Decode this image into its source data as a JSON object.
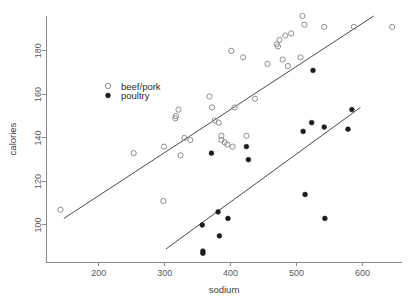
{
  "chart_data": {
    "type": "scatter",
    "title": "",
    "xlabel": "sodium",
    "ylabel": "calories",
    "xlim": [
      120,
      660
    ],
    "ylim": [
      83,
      196
    ],
    "grid": false,
    "xticks": [
      200,
      300,
      400,
      500,
      600
    ],
    "yticks": [
      100,
      120,
      140,
      160,
      180
    ],
    "legend_position": "upper-left-inside",
    "series": [
      {
        "name": "beef/pork",
        "marker": "open-circle",
        "color": "#8e8e8e",
        "points": [
          [
            142,
            107
          ],
          [
            253,
            133
          ],
          [
            298,
            111
          ],
          [
            299,
            136
          ],
          [
            316,
            149
          ],
          [
            317,
            150
          ],
          [
            321,
            153
          ],
          [
            324,
            132
          ],
          [
            330,
            140
          ],
          [
            339,
            139
          ],
          [
            368,
            159
          ],
          [
            372,
            154
          ],
          [
            376,
            148
          ],
          [
            382,
            147
          ],
          [
            386,
            139
          ],
          [
            386,
            141
          ],
          [
            391,
            138
          ],
          [
            395,
            137
          ],
          [
            401,
            180
          ],
          [
            403,
            136
          ],
          [
            406,
            154
          ],
          [
            419,
            177
          ],
          [
            424,
            141
          ],
          [
            437,
            158
          ],
          [
            456,
            174
          ],
          [
            470,
            183
          ],
          [
            472,
            182
          ],
          [
            474,
            185
          ],
          [
            479,
            176
          ],
          [
            483,
            187
          ],
          [
            487,
            173
          ],
          [
            492,
            188
          ],
          [
            506,
            177
          ],
          [
            509,
            196
          ],
          [
            512,
            192
          ],
          [
            542,
            191
          ],
          [
            587,
            191
          ],
          [
            645,
            191
          ]
        ]
      },
      {
        "name": "poultry",
        "marker": "filled-circle",
        "color": "#1c1c1c",
        "points": [
          [
            357,
            100
          ],
          [
            358,
            88
          ],
          [
            358,
            87
          ],
          [
            371,
            133
          ],
          [
            381,
            106
          ],
          [
            383,
            95
          ],
          [
            396,
            103
          ],
          [
            424,
            136
          ],
          [
            427,
            130
          ],
          [
            510,
            143
          ],
          [
            513,
            114
          ],
          [
            523,
            147
          ],
          [
            525,
            171
          ],
          [
            542,
            145
          ],
          [
            543,
            103
          ],
          [
            578,
            144
          ],
          [
            584,
            153
          ]
        ]
      }
    ],
    "fit_lines": [
      {
        "for_series": "beef/pork",
        "x_start": 147,
        "y_start": 103,
        "x_end": 617,
        "y_end": 196
      },
      {
        "for_series": "poultry",
        "x_start": 302,
        "y_start": 89,
        "x_end": 597,
        "y_end": 154
      }
    ]
  },
  "legend": {
    "entries": [
      {
        "label": "beef/pork",
        "marker": "open-circle"
      },
      {
        "label": "poultry",
        "marker": "filled-circle"
      }
    ]
  },
  "axes": {
    "x_title": "sodium",
    "y_title": "calories",
    "x_tick_labels": [
      "200",
      "300",
      "400",
      "500",
      "600"
    ],
    "y_tick_labels": [
      "100",
      "120",
      "140",
      "160",
      "180"
    ]
  }
}
